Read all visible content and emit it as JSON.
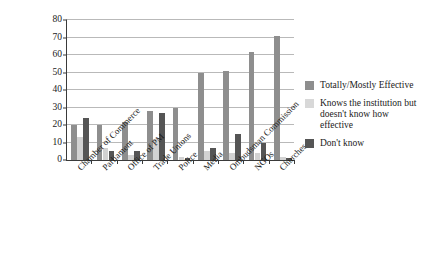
{
  "chart_data": {
    "type": "bar",
    "title": "",
    "subtitle": "",
    "xlabel": "",
    "ylabel": "",
    "ylim": [
      0,
      80
    ],
    "y_ticks": [
      0,
      10,
      20,
      30,
      40,
      50,
      60,
      70,
      80
    ],
    "grid": true,
    "legend_position": "right",
    "categories": [
      "Chamber of Commerce",
      "Parliament",
      "Office of PM",
      "Trade Unions",
      "Police",
      "Media",
      "Ombudsman Commission",
      "NGOs",
      "Churches"
    ],
    "series": [
      {
        "name": "Totally/Mostly Effective",
        "color": "#8e8e8e",
        "values": [
          20,
          20,
          22,
          28,
          30,
          50,
          51,
          62,
          71
        ]
      },
      {
        "name": "Knows the institution but doesn't know how effective",
        "color": "#d2d2d2",
        "values": [
          13,
          7,
          3,
          12,
          2,
          5,
          4,
          4,
          2
        ]
      },
      {
        "name": "Don't know",
        "color": "#555555",
        "values": [
          24,
          5,
          5,
          27,
          1,
          7,
          15,
          10,
          1
        ]
      }
    ]
  },
  "legend": {
    "entries": [
      {
        "label": "Totally/Mostly Effective"
      },
      {
        "label": "Knows the institution but doesn't know how effective"
      },
      {
        "label": "Don't know"
      }
    ]
  }
}
